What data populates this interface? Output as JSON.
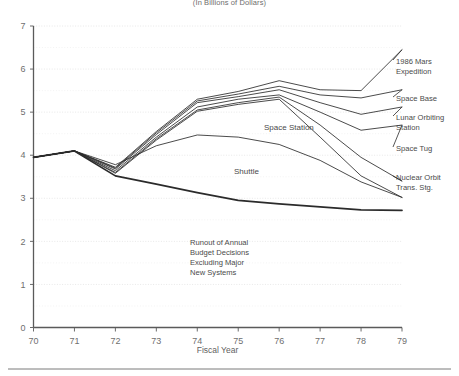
{
  "subtitle": "(In Billions of Dollars)",
  "axes": {
    "x_title": "Fiscal Year",
    "x_ticks": [
      "70",
      "71",
      "72",
      "73",
      "74",
      "75",
      "76",
      "77",
      "78",
      "79"
    ],
    "y_ticks": [
      "0",
      "1",
      "2",
      "3",
      "4",
      "5",
      "6",
      "7"
    ]
  },
  "labels": {
    "mars": "1986 Mars",
    "mars2": "Expedition",
    "space_base": "Space Base",
    "lunar": "Lunar Orbiting",
    "lunar2": "Station",
    "space_tug": "Space Tug",
    "nuclear": "Nuclear Orbit",
    "nuclear2": "Trans. Stg.",
    "space_station": "Space Station",
    "shuttle": "Shuttle"
  },
  "annotation": {
    "line1": "Runout of Annual",
    "line2": "Budget Decisions",
    "line3": "Excluding Major",
    "line4": "New Systems"
  },
  "colors": {
    "line": "#2b2b2b",
    "grid": "#d8d8d8",
    "axis": "#5a5a5a",
    "text": "#4a4a4a",
    "background": "#ffffff"
  },
  "chart_data": {
    "type": "line",
    "title": "",
    "subtitle": "(In Billions of Dollars)",
    "xlabel": "Fiscal Year",
    "ylabel": "",
    "xlim": [
      70,
      79
    ],
    "ylim": [
      0,
      7
    ],
    "ytick_step": 1,
    "yminor_step": 0.5,
    "grid": true,
    "legend": "inline-right-labels",
    "x": [
      70,
      71,
      72,
      73,
      74,
      75,
      76,
      77,
      78,
      79
    ],
    "series": [
      {
        "name": "1986 Mars Expedition",
        "label_side": "right",
        "thick": false,
        "values": [
          3.95,
          4.1,
          3.72,
          4.55,
          5.3,
          5.48,
          5.73,
          5.52,
          5.5,
          6.45
        ]
      },
      {
        "name": "Space Base",
        "label_side": "right",
        "thick": false,
        "values": [
          3.95,
          4.1,
          3.7,
          4.52,
          5.26,
          5.42,
          5.6,
          5.4,
          5.33,
          5.52
        ]
      },
      {
        "name": "Lunar Orbiting Station",
        "label_side": "right",
        "thick": false,
        "values": [
          3.95,
          4.1,
          3.68,
          4.48,
          5.22,
          5.36,
          5.52,
          5.22,
          4.95,
          5.12
        ]
      },
      {
        "name": "Space Tug",
        "label_side": "right",
        "thick": false,
        "values": [
          3.95,
          4.1,
          3.64,
          4.42,
          5.12,
          5.3,
          5.4,
          5.0,
          4.58,
          4.7
        ]
      },
      {
        "name": "Nuclear Orbit Trans. Stg.",
        "label_side": "right",
        "thick": false,
        "values": [
          3.95,
          4.1,
          3.6,
          4.38,
          5.05,
          5.22,
          5.35,
          4.7,
          3.95,
          3.4
        ]
      },
      {
        "name": "Space Station",
        "label_side": "inline",
        "thick": false,
        "values": [
          3.95,
          4.1,
          3.58,
          4.35,
          5.02,
          5.18,
          5.3,
          4.42,
          3.52,
          3.02
        ]
      },
      {
        "name": "Shuttle",
        "label_side": "inline",
        "thick": false,
        "values": [
          3.95,
          4.1,
          3.78,
          4.22,
          4.47,
          4.42,
          4.25,
          3.88,
          3.38,
          3.02
        ]
      },
      {
        "name": "Runout of Annual Budget Decisions Excluding Major New Systems",
        "label_side": "annotation",
        "thick": true,
        "values": [
          3.95,
          4.1,
          3.52,
          3.33,
          3.13,
          2.95,
          2.87,
          2.8,
          2.73,
          2.72
        ]
      }
    ]
  }
}
